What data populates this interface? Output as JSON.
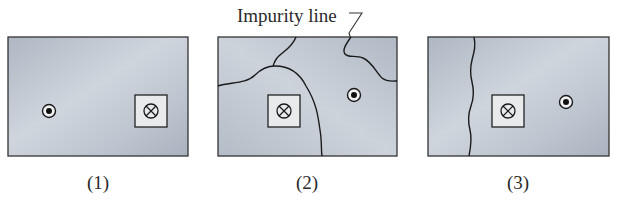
{
  "figure": {
    "annotation": "Impurity line",
    "panels": [
      {
        "caption": "(1)",
        "frame": {
          "x": 8,
          "y": 37,
          "w": 180,
          "h": 119
        },
        "dot_out_of_page": {
          "cx": 49,
          "cy": 111
        },
        "cross_into_page_box": {
          "x": 135,
          "y": 95,
          "size": 32
        },
        "impurity_lines": []
      },
      {
        "caption": "(2)",
        "frame": {
          "x": 218,
          "y": 37,
          "w": 179,
          "h": 119
        },
        "dot_out_of_page": {
          "cx": 354,
          "cy": 95
        },
        "cross_into_page_box": {
          "x": 268,
          "y": 95,
          "size": 32
        },
        "impurity_lines": [
          "grain-boundary-left",
          "grain-boundary-right"
        ]
      },
      {
        "caption": "(3)",
        "frame": {
          "x": 428,
          "y": 37,
          "w": 181,
          "h": 119
        },
        "dot_out_of_page": {
          "cx": 566,
          "cy": 102
        },
        "cross_into_page_box": {
          "x": 492,
          "y": 95,
          "size": 32
        },
        "impurity_lines": [
          "vertical-wavy-line"
        ]
      }
    ],
    "symbols": {
      "dot_icon": "circle-with-dot (out of page)",
      "cross_icon": "circle-with-cross (into page)"
    },
    "colors": {
      "panel_fill_light": "#c9d0d9",
      "panel_fill_dark": "#a9b2be",
      "box_fill": "#e9eaec",
      "line": "#222222"
    }
  }
}
